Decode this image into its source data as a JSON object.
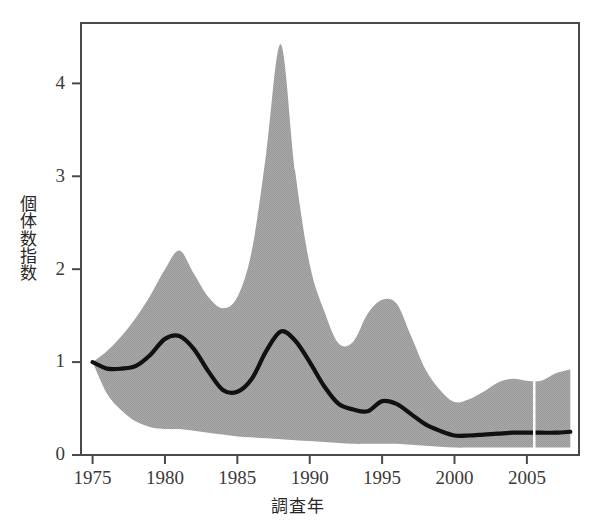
{
  "chart_data": {
    "type": "area",
    "title": "",
    "xlabel": "調査年",
    "ylabel": "個体数指数",
    "ylabel_chars": [
      "個",
      "体",
      "数",
      "指",
      "数"
    ],
    "xlim": [
      1974.2,
      2008.6
    ],
    "ylim": [
      0,
      4.65
    ],
    "xticks": [
      1975,
      1980,
      1985,
      1990,
      1995,
      2000,
      2005
    ],
    "xtick_labels": [
      "1975",
      "1980",
      "1985",
      "1990",
      "1995",
      "2000",
      "2005"
    ],
    "yticks": [
      0,
      1,
      2,
      3,
      4
    ],
    "ytick_labels": [
      "0",
      "1",
      "2",
      "3",
      "4"
    ],
    "grid": false,
    "legend": null,
    "colors": {
      "band_fill": "#a3a3a3",
      "line": "#111111",
      "axis": "#4a4a4a",
      "background": "#ffffff"
    },
    "series": [
      {
        "name": "個体数指数 (trend)",
        "type": "line",
        "x": [
          1975,
          1976,
          1977,
          1978,
          1979,
          1980,
          1981,
          1982,
          1983,
          1984,
          1985,
          1986,
          1987,
          1988,
          1989,
          1990,
          1991,
          1992,
          1993,
          1994,
          1995,
          1996,
          1997,
          1998,
          1999,
          2000,
          2001,
          2002,
          2003,
          2004,
          2005,
          2006,
          2007,
          2008
        ],
        "values": [
          1.0,
          0.93,
          0.93,
          0.96,
          1.08,
          1.25,
          1.28,
          1.14,
          0.9,
          0.7,
          0.68,
          0.82,
          1.12,
          1.33,
          1.23,
          1.0,
          0.74,
          0.55,
          0.49,
          0.47,
          0.58,
          0.55,
          0.44,
          0.33,
          0.26,
          0.21,
          0.21,
          0.22,
          0.23,
          0.24,
          0.24,
          0.24,
          0.24,
          0.25
        ]
      },
      {
        "name": "信頼区間 上限",
        "type": "band-upper",
        "x": [
          1975,
          1976,
          1977,
          1978,
          1979,
          1980,
          1981,
          1982,
          1983,
          1984,
          1985,
          1986,
          1987,
          1988,
          1989,
          1990,
          1991,
          1992,
          1993,
          1994,
          1995,
          1996,
          1997,
          1998,
          1999,
          2000,
          2001,
          2002,
          2003,
          2004,
          2005,
          2006,
          2007,
          2008
        ],
        "values": [
          1.0,
          1.12,
          1.28,
          1.48,
          1.72,
          2.0,
          2.2,
          1.95,
          1.7,
          1.58,
          1.7,
          2.2,
          3.25,
          4.42,
          3.05,
          2.05,
          1.55,
          1.2,
          1.22,
          1.52,
          1.67,
          1.63,
          1.28,
          0.92,
          0.7,
          0.57,
          0.6,
          0.68,
          0.78,
          0.82,
          0.8,
          0.8,
          0.88,
          0.92
        ]
      },
      {
        "name": "信頼区間 下限",
        "type": "band-lower",
        "x": [
          1975,
          1976,
          1977,
          1978,
          1979,
          1980,
          1981,
          1982,
          1983,
          1984,
          1985,
          1986,
          1987,
          1988,
          1989,
          1990,
          1991,
          1992,
          1993,
          1994,
          1995,
          1996,
          1997,
          1998,
          1999,
          2000,
          2001,
          2002,
          2003,
          2004,
          2005,
          2006,
          2007,
          2008
        ],
        "values": [
          1.0,
          0.66,
          0.48,
          0.36,
          0.3,
          0.28,
          0.28,
          0.26,
          0.24,
          0.22,
          0.2,
          0.19,
          0.18,
          0.17,
          0.16,
          0.15,
          0.14,
          0.13,
          0.12,
          0.12,
          0.12,
          0.12,
          0.11,
          0.1,
          0.09,
          0.08,
          0.08,
          0.08,
          0.08,
          0.08,
          0.08,
          0.08,
          0.08,
          0.08
        ]
      }
    ],
    "annotations": [
      {
        "name": "peak-1988",
        "x": 1988,
        "y": 4.42,
        "text": ""
      },
      {
        "name": "peak-1981",
        "x": 1981,
        "y": 1.28,
        "text": ""
      }
    ]
  }
}
